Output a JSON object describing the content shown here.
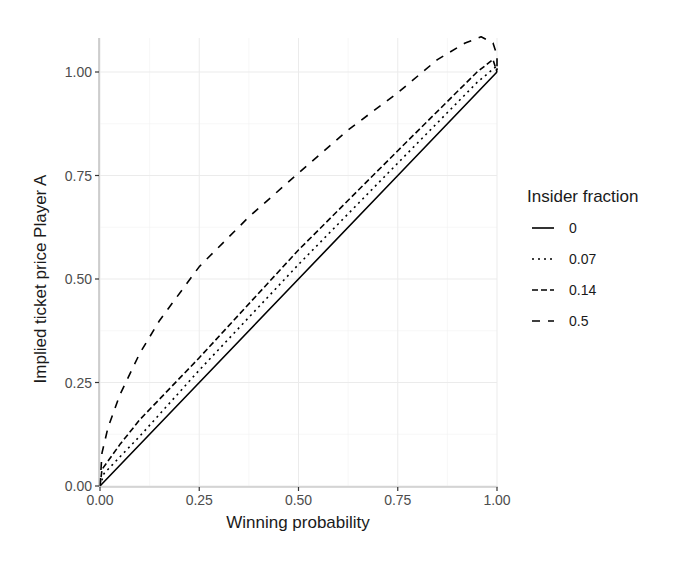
{
  "chart_data": {
    "type": "line",
    "title": "",
    "xlabel": "Winning probability",
    "ylabel": "Implied ticket price Player A",
    "xlim": [
      0,
      1
    ],
    "ylim": [
      0,
      1.08
    ],
    "x_ticks": [
      "0.00",
      "0.25",
      "0.50",
      "0.75",
      "1.00"
    ],
    "y_ticks": [
      "0.00",
      "0.25",
      "0.50",
      "0.75",
      "1.00"
    ],
    "grid": true,
    "legend": {
      "title": "Insider fraction",
      "position": "right",
      "entries": [
        "0",
        "0.07",
        "0.14",
        "0.5"
      ]
    },
    "series": [
      {
        "name": "0",
        "linetype": "solid",
        "points": [
          [
            0,
            0
          ],
          [
            0.25,
            0.25
          ],
          [
            0.5,
            0.5
          ],
          [
            0.75,
            0.75
          ],
          [
            1.0,
            1.0
          ]
        ]
      },
      {
        "name": "0.07",
        "linetype": "dotted",
        "points": [
          [
            0,
            0
          ],
          [
            0.01,
            0.03
          ],
          [
            0.05,
            0.07
          ],
          [
            0.1,
            0.12
          ],
          [
            0.25,
            0.28
          ],
          [
            0.5,
            0.535
          ],
          [
            0.75,
            0.78
          ],
          [
            0.95,
            0.975
          ],
          [
            1.0,
            1.015
          ],
          [
            1.0,
            1.0
          ]
        ]
      },
      {
        "name": "0.14",
        "linetype": "dashed-short",
        "points": [
          [
            0,
            0
          ],
          [
            0.005,
            0.04
          ],
          [
            0.02,
            0.06
          ],
          [
            0.05,
            0.1
          ],
          [
            0.1,
            0.16
          ],
          [
            0.25,
            0.31
          ],
          [
            0.5,
            0.57
          ],
          [
            0.75,
            0.81
          ],
          [
            0.95,
            1.0
          ],
          [
            0.99,
            1.03
          ],
          [
            1.0,
            1.0
          ]
        ]
      },
      {
        "name": "0.5",
        "linetype": "dashed-long",
        "points": [
          [
            0,
            0
          ],
          [
            0.005,
            0.08
          ],
          [
            0.02,
            0.14
          ],
          [
            0.05,
            0.22
          ],
          [
            0.1,
            0.32
          ],
          [
            0.15,
            0.4
          ],
          [
            0.25,
            0.53
          ],
          [
            0.375,
            0.65
          ],
          [
            0.5,
            0.756
          ],
          [
            0.625,
            0.86
          ],
          [
            0.75,
            0.95
          ],
          [
            0.85,
            1.03
          ],
          [
            0.92,
            1.07
          ],
          [
            0.96,
            1.085
          ],
          [
            0.99,
            1.07
          ],
          [
            1.0,
            1.04
          ],
          [
            1.0,
            1.0
          ]
        ]
      }
    ]
  }
}
